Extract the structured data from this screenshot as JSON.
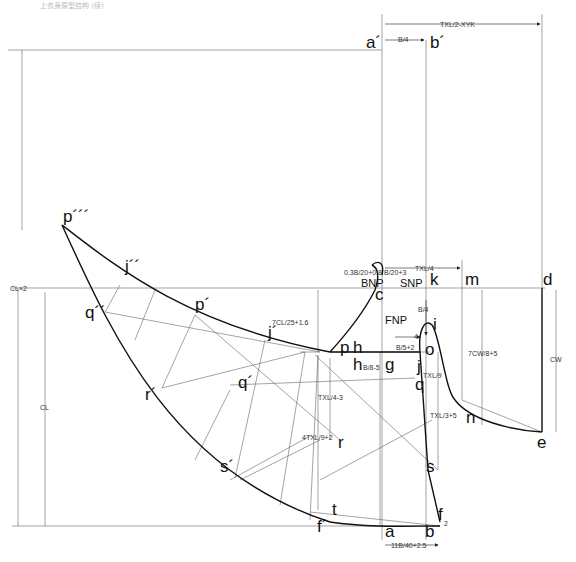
{
  "caption": "上衣身原型结构 (续)",
  "points": {
    "a_prime": "a´",
    "b_prime": "b´",
    "p3": "p´´´",
    "j2": "j´´",
    "q2": "q´´",
    "p1": "p´",
    "j1": "j´",
    "q1": "q´",
    "r1": "r´",
    "s1": "s´",
    "f1": "f´",
    "c": "c",
    "k": "k",
    "m": "m",
    "d": "d",
    "i": "i",
    "o": "o",
    "p": "p",
    "h": "h",
    "h2": "h",
    "g": "g",
    "j": "j",
    "q": "q",
    "r": "r",
    "s": "s",
    "t": "t",
    "f": "f",
    "a": "a",
    "b": "b",
    "n": "n",
    "e": "e"
  },
  "labels": {
    "bnp": "BNP",
    "snp": "SNP",
    "fnp": "FNP"
  },
  "dimensions": {
    "top_width": "TXL/2-XYK",
    "b4_top": "B/4",
    "txl4": "TXL/4",
    "neck_w1": "0.3B/20+0.8",
    "neck_w2": "B/20+3",
    "cl2": "CL×2",
    "cl": "CL",
    "cl_ratio": "7CL/25+1.6",
    "b4_mid": "B/4",
    "four": "4",
    "b5": "B/5+2",
    "b8": "B/8-5",
    "txl9": "TXL/9",
    "txl4_3": "TXL/4-3",
    "txl3_5": "TXL/3+5",
    "four_txl": "4TXL/9+2",
    "cw_ratio": "7CW/8+5",
    "cw": "CW",
    "two": "2",
    "bottom_width": "11B/40+2.5"
  }
}
